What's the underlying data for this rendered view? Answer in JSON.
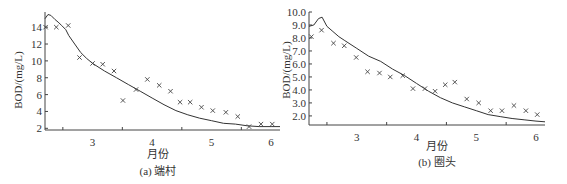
{
  "chart_data": [
    {
      "type": "scatter+line",
      "caption": "(a) 端村",
      "xlabel": "月份",
      "ylabel": "BOD/(mg/L)",
      "xlim": [
        2.2,
        6.15
      ],
      "ylim": [
        1.8,
        15.8
      ],
      "xticks": [
        3,
        4,
        5,
        6
      ],
      "yticks": [
        2,
        4,
        6,
        8,
        10,
        12,
        14
      ],
      "ytick_labels": [
        "2",
        "4",
        "6",
        "8",
        "10",
        "12",
        "14"
      ],
      "grid": false,
      "series": [
        {
          "name": "observed",
          "style": "x-markers",
          "x": [
            2.21,
            2.39,
            2.59,
            2.78,
            3.0,
            3.17,
            3.36,
            3.51,
            3.73,
            3.92,
            4.12,
            4.31,
            4.47,
            4.64,
            4.83,
            5.02,
            5.24,
            5.44,
            5.63,
            5.83,
            6.02
          ],
          "y": [
            14.0,
            14.0,
            14.2,
            10.4,
            9.7,
            9.6,
            8.8,
            5.3,
            6.6,
            7.8,
            7.1,
            6.4,
            5.1,
            5.1,
            4.5,
            4.1,
            3.9,
            3.4,
            2.2,
            2.5,
            2.5
          ]
        },
        {
          "name": "simulated",
          "style": "line",
          "x": [
            2.2,
            2.25,
            2.3,
            2.37,
            2.42,
            2.48,
            2.55,
            2.6,
            2.7,
            2.8,
            2.9,
            3.0,
            3.2,
            3.4,
            3.6,
            3.8,
            4.0,
            4.2,
            4.4,
            4.6,
            4.8,
            5.0,
            5.2,
            5.4,
            5.6,
            5.8,
            6.0,
            6.15
          ],
          "y": [
            15.0,
            15.5,
            15.4,
            14.9,
            14.6,
            14.2,
            13.7,
            13.0,
            12.0,
            11.0,
            10.3,
            9.7,
            8.8,
            8.0,
            7.2,
            6.4,
            5.6,
            4.8,
            4.1,
            3.6,
            3.2,
            2.9,
            2.6,
            2.5,
            2.3,
            2.2,
            2.2,
            2.2
          ]
        }
      ]
    },
    {
      "type": "scatter+line",
      "caption": "(b) 圈头",
      "xlabel": "月份",
      "ylabel": "BOD/(mg/L)",
      "xlim": [
        2.2,
        6.15
      ],
      "ylim": [
        1.3,
        10.0
      ],
      "xticks": [
        3,
        4,
        5,
        6
      ],
      "yticks": [
        2.0,
        3.0,
        4.0,
        5.0,
        6.0,
        7.0,
        8.0,
        9.0,
        10.0
      ],
      "ytick_labels": [
        "2.0",
        "3.0",
        "4.0",
        "5.0",
        "6.0",
        "7.0",
        "8.0",
        "9.0",
        "10.0"
      ],
      "grid": false,
      "series": [
        {
          "name": "observed",
          "style": "x-markers",
          "x": [
            2.24,
            2.41,
            2.61,
            2.79,
            2.99,
            3.18,
            3.38,
            3.56,
            3.77,
            3.94,
            4.14,
            4.31,
            4.48,
            4.64,
            4.84,
            5.04,
            5.24,
            5.43,
            5.63,
            5.83,
            6.02
          ],
          "y": [
            8.1,
            8.6,
            7.6,
            7.4,
            6.5,
            5.4,
            5.3,
            5.0,
            5.1,
            4.1,
            4.1,
            3.9,
            4.4,
            4.6,
            3.3,
            3.0,
            2.4,
            2.4,
            2.8,
            2.4,
            2.1
          ]
        },
        {
          "name": "simulated",
          "style": "line",
          "x": [
            2.2,
            2.28,
            2.36,
            2.42,
            2.5,
            2.6,
            2.7,
            2.8,
            3.0,
            3.2,
            3.4,
            3.6,
            3.8,
            4.0,
            4.2,
            4.4,
            4.6,
            4.8,
            5.0,
            5.2,
            5.4,
            5.6,
            5.8,
            6.0,
            6.15
          ],
          "y": [
            8.9,
            9.0,
            9.5,
            9.6,
            8.9,
            8.5,
            8.1,
            7.8,
            7.2,
            6.6,
            6.2,
            5.6,
            5.1,
            4.5,
            3.9,
            3.4,
            3.0,
            2.7,
            2.4,
            2.1,
            1.95,
            1.8,
            1.7,
            1.6,
            1.55
          ]
        }
      ]
    }
  ],
  "charts": {
    "a": {
      "caption": "(a) 端村",
      "xlabel": "月份",
      "ylabel": "BOD/(mg/L)"
    },
    "b": {
      "caption": "(b) 圈头",
      "xlabel": "月份",
      "ylabel": "BOD/(mg/L)"
    }
  },
  "colors": {
    "ink": "#333333",
    "axis": "#444444",
    "background": "#ffffff"
  }
}
